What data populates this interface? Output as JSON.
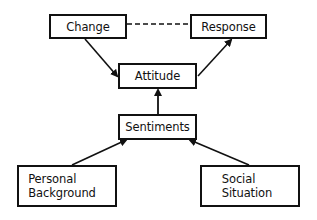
{
  "diagram": {
    "type": "flow",
    "nodes": {
      "change": {
        "label": "Change"
      },
      "response": {
        "label": "Response"
      },
      "attitude": {
        "label": "Attitude"
      },
      "sentiments": {
        "label": "Sentiments"
      },
      "personal_background": {
        "line1": "Personal",
        "line2": "Background"
      },
      "social_situation": {
        "line1": "Social",
        "line2": "Situation"
      }
    },
    "edges": [
      {
        "from": "Change",
        "to": "Attitude",
        "style": "solid-arrow"
      },
      {
        "from": "Attitude",
        "to": "Response",
        "style": "solid-arrow"
      },
      {
        "from": "Sentiments",
        "to": "Attitude",
        "style": "solid-arrow"
      },
      {
        "from": "Personal Background",
        "to": "Sentiments",
        "style": "solid-arrow"
      },
      {
        "from": "Social Situation",
        "to": "Sentiments",
        "style": "solid-arrow"
      },
      {
        "from": "Change",
        "to": "Response",
        "style": "dashed-line"
      }
    ],
    "colors": {
      "stroke": "#111111",
      "background": "#ffffff"
    }
  }
}
